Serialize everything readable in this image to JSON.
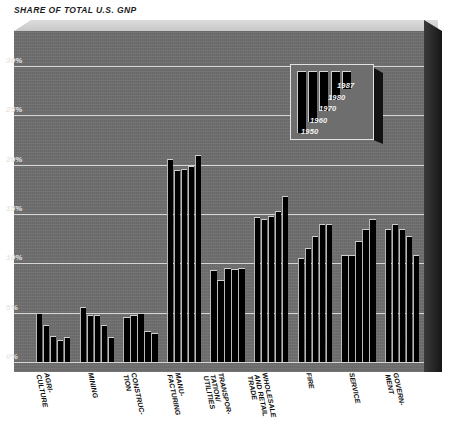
{
  "chart": {
    "title": "SHARE OF TOTAL U.S. GNP"
  },
  "chart_data": {
    "type": "bar",
    "title": "SHARE OF TOTAL U.S. GNP",
    "xlabel": "",
    "ylabel": "",
    "ylim": [
      0,
      32
    ],
    "grid": true,
    "ytick_labels": [
      "0%",
      "5%",
      "10%",
      "15%",
      "20%",
      "25%",
      "30%"
    ],
    "ytick_values": [
      0,
      5,
      10,
      15,
      20,
      25,
      30
    ],
    "legend_position": "inside-top-right",
    "categories": [
      "AGRI-\nCULTURE",
      "MINING",
      "CONSTRUC-\nTION",
      "MANU-\nFACTURING",
      "TRANSPOR-\nTATION/\nUTILITIES",
      "WHOLESALE\nAND RETAIL\nTRADE",
      "FIRE",
      "SERVICE",
      "GOVERN-\nMENT"
    ],
    "series": [
      {
        "name": "1950",
        "values": [
          5.0,
          5.6,
          4.6,
          20.6,
          9.3,
          14.7,
          10.5,
          10.8,
          13.5
        ]
      },
      {
        "name": "1960",
        "values": [
          3.7,
          4.8,
          4.8,
          19.4,
          8.3,
          14.5,
          11.5,
          10.8,
          14.0
        ]
      },
      {
        "name": "1970",
        "values": [
          2.6,
          4.8,
          5.0,
          19.5,
          9.5,
          14.8,
          12.8,
          12.3,
          13.5
        ]
      },
      {
        "name": "1980",
        "values": [
          2.2,
          3.7,
          3.1,
          19.8,
          9.4,
          15.3,
          14.0,
          13.5,
          12.8
        ]
      },
      {
        "name": "1987",
        "values": [
          2.5,
          2.5,
          2.9,
          21.0,
          9.5,
          16.8,
          14.0,
          14.5,
          10.8
        ]
      }
    ]
  },
  "legend": {
    "labels": [
      "1987",
      "1980",
      "1970",
      "1960",
      "1950"
    ]
  },
  "colors": {
    "plot_background": "#6e6e6e",
    "bar": "#000000",
    "gridline": "#d6d6d6",
    "tick_text": "#e8e8e8",
    "title_text": "#1c1c1c"
  }
}
